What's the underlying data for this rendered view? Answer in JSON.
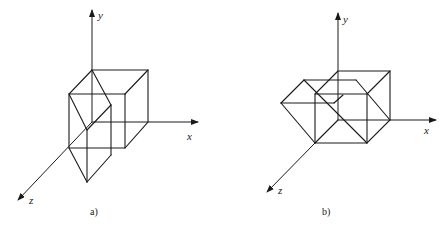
{
  "figure": {
    "panels": [
      {
        "id": "a",
        "caption": "a)",
        "axes": {
          "x": "x",
          "y": "y",
          "z": "z"
        },
        "description": "Cube in first octant with a triangular prism (wedge) attached along the front-left edge, extending toward +z"
      },
      {
        "id": "b",
        "caption": "b)",
        "axes": {
          "x": "x",
          "y": "y",
          "z": "z"
        },
        "description": "Cube in first octant with a triangular prism attached on the left side, extending toward -x"
      }
    ]
  }
}
